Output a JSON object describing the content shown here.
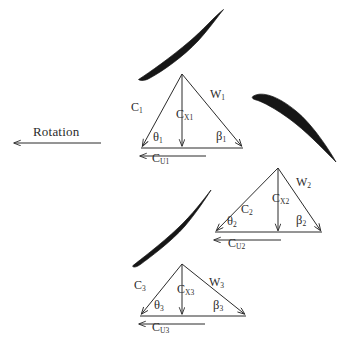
{
  "figure": {
    "background_color": "#ffffff",
    "ink_color": "#2b2b2b",
    "blade_color": "#161616",
    "width": 343,
    "height": 346
  },
  "rotation": {
    "label": "Rotation",
    "direction": "left",
    "arrow": {
      "x1": 101,
      "y1": 143,
      "x2": 13,
      "y2": 143
    }
  },
  "blades": [
    {
      "name": "blade-1",
      "from": [
        138,
        79
      ],
      "to": [
        224,
        9
      ]
    },
    {
      "name": "blade-2",
      "from": [
        253,
        95
      ],
      "to": [
        336,
        162
      ]
    },
    {
      "name": "blade-3",
      "from": [
        132,
        266
      ],
      "to": [
        211,
        190
      ]
    }
  ],
  "triangles": [
    {
      "id": 1,
      "apex": [
        182,
        74
      ],
      "left": [
        141,
        148
      ],
      "right": [
        243,
        148
      ],
      "labels": {
        "c": "C",
        "c_sub": "1",
        "cx": "C",
        "cx_sub": "X1",
        "w": "W",
        "w_sub": "1",
        "theta": "θ",
        "theta_sub": "1",
        "beta": "β",
        "beta_sub": "1",
        "cu": "C",
        "cu_sub": "U1"
      },
      "label_pos": {
        "c": [
          131,
          101
        ],
        "cx": [
          176,
          108
        ],
        "w": [
          210,
          88
        ],
        "theta": [
          153,
          131
        ],
        "beta": [
          216,
          130
        ],
        "cu": [
          152,
          152
        ]
      }
    },
    {
      "id": 2,
      "apex": [
        278,
        168
      ],
      "left": [
        215,
        232
      ],
      "right": [
        322,
        232
      ],
      "labels": {
        "c": "C",
        "c_sub": "2",
        "cx": "C",
        "cx_sub": "X2",
        "w": "W",
        "w_sub": "2",
        "theta": "θ",
        "theta_sub": "2",
        "beta": "β",
        "beta_sub": "2",
        "cu": "C",
        "cu_sub": "U2"
      },
      "label_pos": {
        "c": [
          241,
          203
        ],
        "cx": [
          272,
          192
        ],
        "w": [
          296,
          176
        ],
        "theta": [
          227,
          215
        ],
        "beta": [
          296,
          214
        ],
        "cu": [
          228,
          237
        ]
      }
    },
    {
      "id": 3,
      "apex": [
        182,
        264
      ],
      "left": [
        140,
        316
      ],
      "right": [
        246,
        316
      ],
      "labels": {
        "c": "C",
        "c_sub": "3",
        "cx": "C",
        "cx_sub": "X3",
        "w": "W",
        "w_sub": "3",
        "theta": "θ",
        "theta_sub": "3",
        "beta": "β",
        "beta_sub": "3",
        "cu": "C",
        "cu_sub": "U3"
      },
      "label_pos": {
        "c": [
          134,
          279
        ],
        "cx": [
          177,
          283
        ],
        "w": [
          209,
          276
        ],
        "theta": [
          154,
          299
        ],
        "beta": [
          213,
          299
        ],
        "cu": [
          152,
          321
        ]
      }
    }
  ]
}
